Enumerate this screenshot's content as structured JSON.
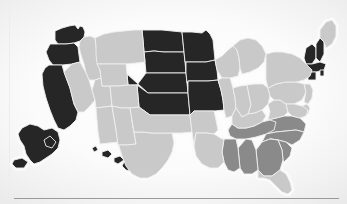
{
  "figure": {
    "kind": "choropleth-map",
    "region": "united-states",
    "background_color": "#fbfbfb",
    "divider_color": "#9a9a9a",
    "state_border_color": "#efefef"
  },
  "legend_colors": {
    "dark": "#262626",
    "medium": "#8a8a8a",
    "light": "#c9c9c9"
  },
  "chart_data": {
    "type": "map",
    "title": "",
    "subtitle": "",
    "xlabel": "",
    "ylabel": "",
    "categories": [
      "dark",
      "medium",
      "light"
    ],
    "category_colors": [
      "#262626",
      "#8a8a8a",
      "#c9c9c9"
    ],
    "legend_position": "none",
    "grid": false,
    "states": [
      {
        "code": "WA",
        "name": "Washington",
        "category": "dark",
        "value": 2
      },
      {
        "code": "OR",
        "name": "Oregon",
        "category": "dark",
        "value": 2
      },
      {
        "code": "CA",
        "name": "California",
        "category": "dark",
        "value": 2
      },
      {
        "code": "AK",
        "name": "Alaska",
        "category": "dark",
        "value": 2
      },
      {
        "code": "HI",
        "name": "Hawaii",
        "category": "dark",
        "value": 2
      },
      {
        "code": "ND",
        "name": "North Dakota",
        "category": "dark",
        "value": 2
      },
      {
        "code": "SD",
        "name": "South Dakota",
        "category": "dark",
        "value": 2
      },
      {
        "code": "NE",
        "name": "Nebraska",
        "category": "dark",
        "value": 2
      },
      {
        "code": "KS",
        "name": "Kansas",
        "category": "dark",
        "value": 2
      },
      {
        "code": "MN",
        "name": "Minnesota",
        "category": "dark",
        "value": 2
      },
      {
        "code": "IA",
        "name": "Iowa",
        "category": "dark",
        "value": 2
      },
      {
        "code": "MO",
        "name": "Missouri",
        "category": "dark",
        "value": 2
      },
      {
        "code": "VT",
        "name": "Vermont",
        "category": "dark",
        "value": 2
      },
      {
        "code": "NH",
        "name": "New Hampshire",
        "category": "dark",
        "value": 2
      },
      {
        "code": "MA",
        "name": "Massachusetts",
        "category": "dark",
        "value": 2
      },
      {
        "code": "CT",
        "name": "Connecticut",
        "category": "dark",
        "value": 2
      },
      {
        "code": "RI",
        "name": "Rhode Island",
        "category": "dark",
        "value": 2
      },
      {
        "code": "VA",
        "name": "Virginia",
        "category": "medium",
        "value": 1
      },
      {
        "code": "NC",
        "name": "North Carolina",
        "category": "medium",
        "value": 1
      },
      {
        "code": "SC",
        "name": "South Carolina",
        "category": "medium",
        "value": 1
      },
      {
        "code": "GA",
        "name": "Georgia",
        "category": "medium",
        "value": 1
      },
      {
        "code": "TN",
        "name": "Tennessee",
        "category": "medium",
        "value": 1
      },
      {
        "code": "AL",
        "name": "Alabama",
        "category": "medium",
        "value": 1
      },
      {
        "code": "MS",
        "name": "Mississippi",
        "category": "medium",
        "value": 1
      },
      {
        "code": "ID",
        "name": "Idaho",
        "category": "light",
        "value": 0
      },
      {
        "code": "MT",
        "name": "Montana",
        "category": "light",
        "value": 0
      },
      {
        "code": "NV",
        "name": "Nevada",
        "category": "light",
        "value": 0
      },
      {
        "code": "UT",
        "name": "Utah",
        "category": "light",
        "value": 0
      },
      {
        "code": "WY",
        "name": "Wyoming",
        "category": "light",
        "value": 0
      },
      {
        "code": "CO",
        "name": "Colorado",
        "category": "light",
        "value": 0
      },
      {
        "code": "AZ",
        "name": "Arizona",
        "category": "light",
        "value": 0
      },
      {
        "code": "NM",
        "name": "New Mexico",
        "category": "light",
        "value": 0
      },
      {
        "code": "TX",
        "name": "Texas",
        "category": "light",
        "value": 0
      },
      {
        "code": "OK",
        "name": "Oklahoma",
        "category": "light",
        "value": 0
      },
      {
        "code": "AR",
        "name": "Arkansas",
        "category": "light",
        "value": 0
      },
      {
        "code": "LA",
        "name": "Louisiana",
        "category": "light",
        "value": 0
      },
      {
        "code": "WI",
        "name": "Wisconsin",
        "category": "light",
        "value": 0
      },
      {
        "code": "IL",
        "name": "Illinois",
        "category": "light",
        "value": 0
      },
      {
        "code": "MI",
        "name": "Michigan",
        "category": "light",
        "value": 0
      },
      {
        "code": "IN",
        "name": "Indiana",
        "category": "light",
        "value": 0
      },
      {
        "code": "OH",
        "name": "Ohio",
        "category": "light",
        "value": 0
      },
      {
        "code": "KY",
        "name": "Kentucky",
        "category": "light",
        "value": 0
      },
      {
        "code": "WV",
        "name": "West Virginia",
        "category": "light",
        "value": 0
      },
      {
        "code": "PA",
        "name": "Pennsylvania",
        "category": "light",
        "value": 0
      },
      {
        "code": "NY",
        "name": "New York",
        "category": "light",
        "value": 0
      },
      {
        "code": "ME",
        "name": "Maine",
        "category": "light",
        "value": 0
      },
      {
        "code": "NJ",
        "name": "New Jersey",
        "category": "light",
        "value": 0
      },
      {
        "code": "DE",
        "name": "Delaware",
        "category": "light",
        "value": 0
      },
      {
        "code": "MD",
        "name": "Maryland",
        "category": "light",
        "value": 0
      },
      {
        "code": "FL",
        "name": "Florida",
        "category": "light",
        "value": 0
      }
    ]
  },
  "geometry": {
    "WA": "M55,31 L62,28 L69,26 L75,25 L78,29 L80,26 L83,27 L85,32 L84,37 L80,41 L74,43 L66,44 L58,44 L55,40 Z",
    "OR": "M50,44 L58,44 L66,44 L74,43 L78,47 L79,55 L80,62 L72,64 L62,65 L53,65 L49,60 L46,52 Z",
    "CA": "M49,65 L53,65 L62,65 L64,72 L67,80 L70,88 L72,96 L74,104 L78,112 L76,120 L70,126 L64,130 L58,128 L54,120 L50,110 L46,98 L43,86 L42,74 L45,68 Z",
    "ID": "M80,41 L84,37 L90,36 L95,38 L96,46 L97,54 L98,62 L100,70 L101,78 L95,80 L89,80 L86,73 L84,64 L81,55 L79,47 Z",
    "NV": "M80,62 L86,73 L89,80 L92,90 L95,100 L90,106 L84,112 L78,112 L74,104 L72,96 L70,88 L67,80 L64,72 L72,64 Z",
    "MT": "M95,38 L104,34 L114,32 L124,31 L134,30 L142,30 L143,40 L144,52 L145,62 L136,63 L126,64 L116,64 L106,64 L97,64 L96,54 L96,46 Z",
    "WY": "M97,64 L106,64 L116,64 L126,64 L127,74 L128,85 L119,86 L110,86 L102,86 L101,78 L100,70 Z",
    "UT": "M95,80 L101,78 L102,86 L110,86 L111,96 L112,106 L104,107 L96,108 L95,100 L92,90 Z",
    "CO": "M110,86 L119,86 L128,85 L137,85 L138,96 L139,107 L130,108 L121,108 L112,106 L111,96 Z",
    "AZ": "M96,108 L104,107 L112,106 L114,118 L116,130 L118,142 L109,143 L100,144 L98,132 L97,120 Z",
    "NM": "M112,106 L121,108 L130,108 L132,120 L134,132 L136,144 L127,145 L118,145 L116,130 L114,118 Z",
    "ND": "M142,30 L152,30 L162,30 L172,31 L182,32 L183,42 L184,52 L174,52 L164,52 L154,51 L144,52 L143,40 Z",
    "SD": "M144,52 L154,51 L164,52 L174,52 L184,52 L185,62 L186,73 L176,73 L166,73 L156,73 L146,73 L145,62 Z",
    "NE": "M146,73 L156,73 L166,73 L176,73 L186,73 L187,83 L188,93 L178,93 L168,93 L158,93 L148,93 L127,74 L128,85 L137,85 Z",
    "KS": "M137,85 L148,93 L158,93 L168,93 L178,93 L188,93 L189,104 L190,115 L180,115 L170,115 L160,115 L150,115 L139,107 L138,96 Z",
    "OK": "M139,107 L150,115 L160,115 L170,115 L180,115 L190,115 L191,124 L192,132 L182,133 L172,133 L162,133 L152,133 L142,132 L134,132 L132,120 L130,108 Z",
    "TX": "M132,120 L134,132 L142,132 L152,133 L162,133 L172,133 L174,143 L172,152 L168,160 L162,168 L156,174 L148,178 L140,178 L132,174 L126,166 L122,156 L119,146 L118,145 L127,145 L136,144 L134,132 Z",
    "MN": "M182,32 L192,32 L202,33 L206,30 L210,34 L213,40 L214,50 L215,60 L206,62 L196,62 L186,62 L185,62 L184,52 L183,42 Z",
    "IA": "M186,62 L196,62 L206,62 L215,60 L217,70 L218,80 L208,81 L198,81 L188,81 L187,83 L186,73 Z",
    "MO": "M188,81 L198,81 L208,81 L218,80 L221,90 L223,100 L224,110 L214,111 L204,111 L194,111 L190,115 L189,104 L188,93 Z",
    "WI": "M215,60 L222,56 L228,50 L233,46 L237,50 L239,58 L240,68 L238,76 L230,78 L222,78 L217,70 Z",
    "IL": "M218,80 L222,78 L230,78 L233,88 L235,98 L236,108 L232,116 L226,118 L224,110 L223,100 L221,90 Z",
    "MI": "M233,46 L240,40 L248,38 L256,40 L262,46 L266,54 L264,62 L258,68 L250,72 L242,74 L240,68 L239,58 L237,50 Z",
    "IN": "M233,88 L240,86 L247,85 L249,95 L251,105 L248,114 L242,117 L236,108 L235,98 Z",
    "OH": "M247,85 L255,84 L263,84 L268,88 L270,96 L268,104 L262,110 L255,113 L248,114 L251,105 L249,95 Z",
    "KY": "M236,108 L242,117 L248,114 L255,113 L262,110 L266,116 L262,122 L254,126 L246,128 L238,128 L232,124 L232,116 Z",
    "TN": "M232,124 L238,128 L246,128 L254,126 L262,122 L270,120 L276,122 L274,130 L266,134 L256,137 L246,139 L236,139 L230,136 L228,130 Z",
    "MS": "M224,139 L232,139 L236,139 L238,148 L239,158 L240,168 L234,172 L228,170 L224,162 L222,152 Z",
    "AL": "M238,148 L246,139 L252,140 L256,150 L257,160 L258,170 L252,174 L244,174 L240,168 L239,158 Z",
    "GA": "M256,150 L262,142 L270,139 L278,140 L282,150 L283,160 L280,170 L272,176 L264,176 L258,170 L257,160 Z",
    "FL": "M258,170 L264,176 L272,176 L280,170 L286,174 L290,182 L292,190 L288,194 L282,192 L276,186 L270,180 L264,178 L258,178 Z",
    "LA": "M196,133 L206,133 L214,134 L222,139 L224,139 L222,152 L224,162 L218,168 L210,168 L202,164 L196,156 L194,146 Z",
    "AR": "M194,111 L204,111 L214,111 L216,120 L218,130 L214,134 L206,133 L196,133 L194,146 L192,132 L191,124 L190,115 Z",
    "SC": "M270,139 L278,140 L286,142 L292,148 L290,156 L284,162 L283,160 L282,150 L278,140 Z",
    "NC": "M266,134 L276,132 L286,131 L296,130 L304,132 L300,140 L292,145 L286,142 L278,140 L270,139 L262,142 Z",
    "VA": "M268,120 L276,118 L284,116 L292,116 L300,118 L306,124 L304,132 L296,130 L286,131 L276,132 L266,134 L270,120 Z",
    "WV": "M268,104 L274,100 L280,100 L286,104 L288,112 L284,116 L276,118 L268,120 L270,112 Z",
    "MD": "M286,104 L294,104 L302,106 L308,110 L306,116 L300,118 L292,116 L288,112 Z",
    "DE": "M302,106 L307,104 L310,108 L308,114 L304,114 Z",
    "PA": "M268,88 L276,84 L286,82 L296,82 L304,84 L306,92 L302,100 L294,104 L286,104 L280,100 L274,100 L270,96 Z",
    "NJ": "M304,84 L310,84 L313,90 L312,98 L308,104 L304,102 L306,92 Z",
    "NY": "M266,54 L274,52 L282,52 L292,54 L300,58 L306,64 L312,70 L310,76 L304,80 L296,82 L286,82 L276,84 L268,88 L266,80 L266,70 Z",
    "VT": "M306,48 L312,44 L316,48 L316,58 L312,64 L306,64 L304,58 Z",
    "NH": "M316,44 L320,38 L324,42 L324,54 L320,62 L316,58 L316,48 Z",
    "ME": "M320,30 L326,22 L332,20 L336,26 L336,36 L332,44 L326,48 L324,42 L320,38 Z",
    "MA": "M304,64 L312,64 L320,62 L326,64 L324,70 L316,72 L308,72 L304,70 Z",
    "RI": "M320,70 L324,70 L324,76 L320,76 Z",
    "CT": "M308,72 L316,72 L316,80 L308,80 Z",
    "AK": "M22,128 L30,124 L38,126 L44,130 L52,128 L58,132 L60,140 L58,148 L52,154 L46,158 L40,162 L34,164 L30,160 L26,154 L24,146 L20,140 L18,134 Z M14,160 L22,158 L28,162 L24,168 L16,168 L12,164 Z M44,140 L50,136 L56,142 L52,148 L46,146 Z",
    "HI": "M92,148 L96,146 L98,150 L94,152 Z M102,152 L108,150 L112,154 L108,158 L102,156 Z M114,158 L120,156 L124,160 L118,164 L114,162 Z M124,162 L132,160 L138,166 L134,172 L126,170 L122,166 Z"
  }
}
